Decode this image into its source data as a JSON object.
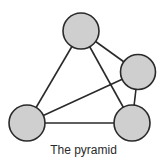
{
  "diagram": {
    "title": "The pyramid",
    "colors": {
      "node_fill": "#cfcfcf",
      "stroke": "#2a2a2a",
      "background": "#ffffff"
    },
    "nodes": [
      {
        "id": "top",
        "cx": 81,
        "cy": 31,
        "r": 18
      },
      {
        "id": "right",
        "cx": 138,
        "cy": 72,
        "r": 17.5
      },
      {
        "id": "bottom-left",
        "cx": 27,
        "cy": 123,
        "r": 18
      },
      {
        "id": "bottom-right",
        "cx": 132,
        "cy": 123,
        "r": 18
      }
    ],
    "edges": [
      {
        "from": "top",
        "to": "bottom-left"
      },
      {
        "from": "top",
        "to": "right"
      },
      {
        "from": "top",
        "to": "bottom-right"
      },
      {
        "from": "bottom-left",
        "to": "right"
      },
      {
        "from": "bottom-left",
        "to": "bottom-right"
      },
      {
        "from": "right",
        "to": "bottom-right"
      }
    ]
  }
}
